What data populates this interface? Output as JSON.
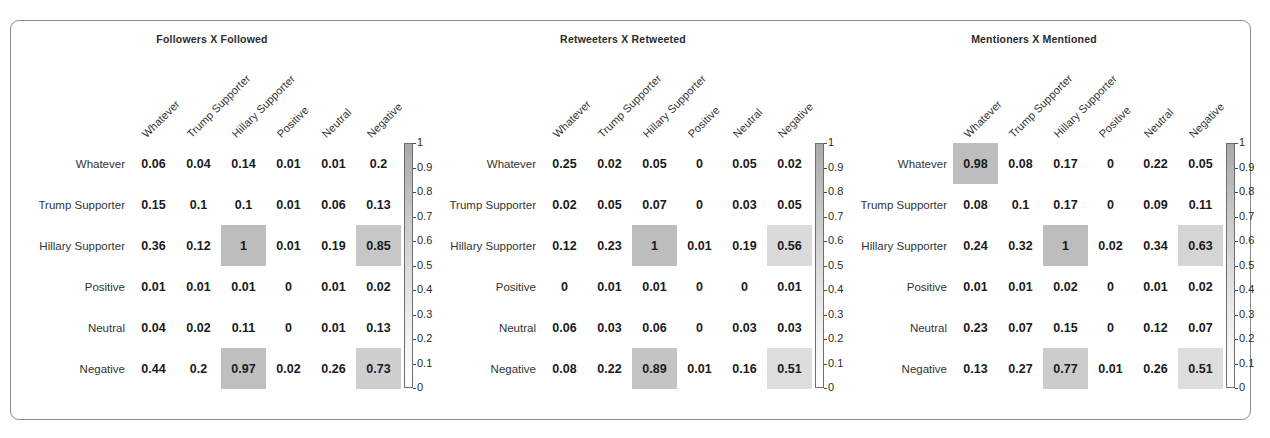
{
  "figure": {
    "caption": "",
    "row_labels": [
      "Whatever",
      "Trump Supporter",
      "Hillary Supporter",
      "Positive",
      "Neutral",
      "Negative"
    ],
    "col_labels": [
      "Whatever",
      "Trump Supporter",
      "Hillary Supporter",
      "Positive",
      "Neutral",
      "Negative"
    ],
    "colorbar_ticks": [
      "1",
      "0.9",
      "0.8",
      "0.7",
      "0.6",
      "0.5",
      "0.4",
      "0.3",
      "0.2",
      "0.1",
      "0"
    ],
    "colors": {
      "frame_border": "#8a8a8a",
      "cell_high": "#bfbfbf",
      "cell_mid": "#dedede",
      "text": "#1a1a1a"
    }
  },
  "chart_data": [
    {
      "type": "heatmap",
      "title": "Followers X Followed",
      "xlabel": "",
      "ylabel": "",
      "x_tick_labels": [
        "Whatever",
        "Trump Supporter",
        "Hillary Supporter",
        "Positive",
        "Neutral",
        "Negative"
      ],
      "y_tick_labels": [
        "Whatever",
        "Trump Supporter",
        "Hillary Supporter",
        "Positive",
        "Neutral",
        "Negative"
      ],
      "zlim": [
        0,
        1
      ],
      "colorbar_ticks": [
        1,
        0.9,
        0.8,
        0.7,
        0.6,
        0.5,
        0.4,
        0.3,
        0.2,
        0.1,
        0
      ],
      "grid": false,
      "values": [
        [
          "0.06",
          "0.04",
          "0.14",
          "0.01",
          "0.01",
          "0.2"
        ],
        [
          "0.15",
          "0.1",
          "0.1",
          "0.01",
          "0.06",
          "0.13"
        ],
        [
          "0.36",
          "0.12",
          "1",
          "0.01",
          "0.19",
          "0.85"
        ],
        [
          "0.01",
          "0.01",
          "0.01",
          "0",
          "0.01",
          "0.02"
        ],
        [
          "0.04",
          "0.02",
          "0.11",
          "0",
          "0.01",
          "0.13"
        ],
        [
          "0.44",
          "0.2",
          "0.97",
          "0.02",
          "0.26",
          "0.73"
        ]
      ]
    },
    {
      "type": "heatmap",
      "title": "Retweeters X Retweeted",
      "xlabel": "",
      "ylabel": "",
      "x_tick_labels": [
        "Whatever",
        "Trump Supporter",
        "Hillary Supporter",
        "Positive",
        "Neutral",
        "Negative"
      ],
      "y_tick_labels": [
        "Whatever",
        "Trump Supporter",
        "Hillary Supporter",
        "Positive",
        "Neutral",
        "Negative"
      ],
      "zlim": [
        0,
        1
      ],
      "colorbar_ticks": [
        1,
        0.9,
        0.8,
        0.7,
        0.6,
        0.5,
        0.4,
        0.3,
        0.2,
        0.1,
        0
      ],
      "grid": false,
      "values": [
        [
          "0.25",
          "0.02",
          "0.05",
          "0",
          "0.05",
          "0.02"
        ],
        [
          "0.02",
          "0.05",
          "0.07",
          "0",
          "0.03",
          "0.05"
        ],
        [
          "0.12",
          "0.23",
          "1",
          "0.01",
          "0.19",
          "0.56"
        ],
        [
          "0",
          "0.01",
          "0.01",
          "0",
          "0",
          "0.01"
        ],
        [
          "0.06",
          "0.03",
          "0.06",
          "0",
          "0.03",
          "0.03"
        ],
        [
          "0.08",
          "0.22",
          "0.89",
          "0.01",
          "0.16",
          "0.51"
        ]
      ]
    },
    {
      "type": "heatmap",
      "title": "Mentioners X Mentioned",
      "xlabel": "",
      "ylabel": "",
      "x_tick_labels": [
        "Whatever",
        "Trump Supporter",
        "Hillary Supporter",
        "Positive",
        "Neutral",
        "Negative"
      ],
      "y_tick_labels": [
        "Whatever",
        "Trump Supporter",
        "Hillary Supporter",
        "Positive",
        "Neutral",
        "Negative"
      ],
      "zlim": [
        0,
        1
      ],
      "colorbar_ticks": [
        1,
        0.9,
        0.8,
        0.7,
        0.6,
        0.5,
        0.4,
        0.3,
        0.2,
        0.1,
        0
      ],
      "grid": false,
      "values": [
        [
          "0.98",
          "0.08",
          "0.17",
          "0",
          "0.22",
          "0.05"
        ],
        [
          "0.08",
          "0.1",
          "0.17",
          "0",
          "0.09",
          "0.11"
        ],
        [
          "0.24",
          "0.32",
          "1",
          "0.02",
          "0.34",
          "0.63"
        ],
        [
          "0.01",
          "0.01",
          "0.02",
          "0",
          "0.01",
          "0.02"
        ],
        [
          "0.23",
          "0.07",
          "0.15",
          "0",
          "0.12",
          "0.07"
        ],
        [
          "0.13",
          "0.27",
          "0.77",
          "0.01",
          "0.26",
          "0.51"
        ]
      ]
    }
  ]
}
